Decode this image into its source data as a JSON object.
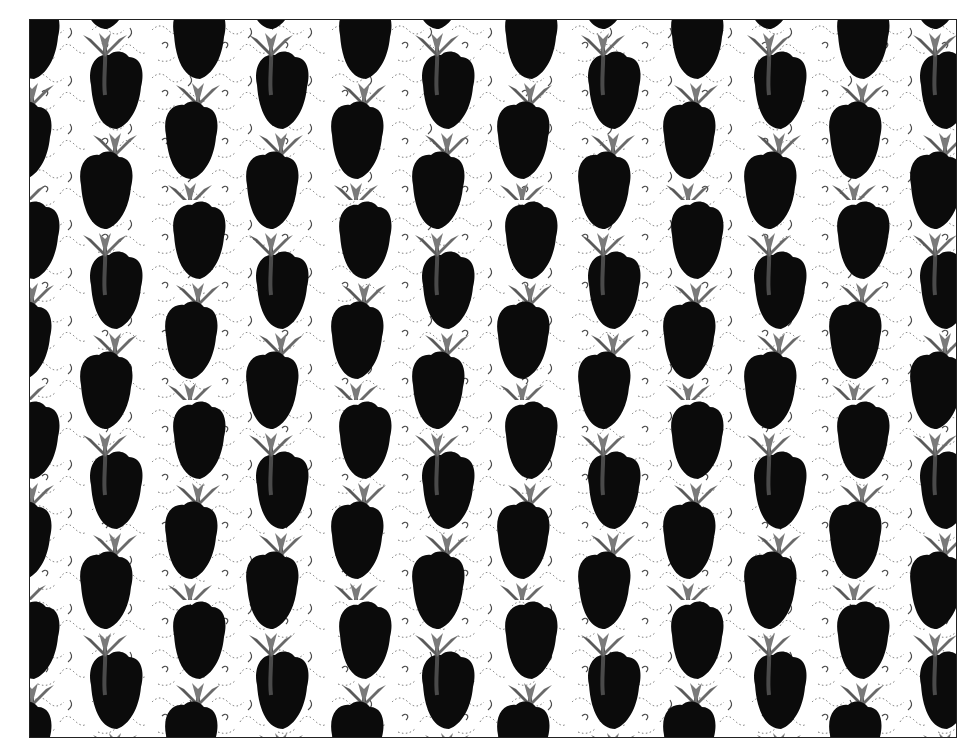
{
  "image": {
    "description": "Autostereogram-style repeating pattern of black tulips with grey stems and leaves over a white background with dotted scribble texture",
    "colors": {
      "background": "#ffffff",
      "petal": "#0a0a0a",
      "leaf": "#5a5a5a",
      "leaf_highlight": "#8a8a8a",
      "texture": "#333333",
      "border": "#222222"
    },
    "pattern": {
      "period_x": 166,
      "period_y": 200,
      "flowers_per_tile": 4
    }
  }
}
